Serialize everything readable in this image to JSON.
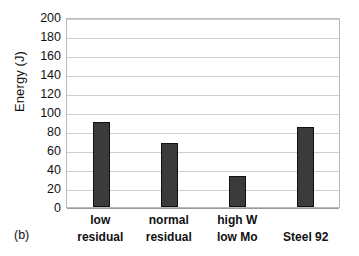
{
  "figure": {
    "panel_label": "(b)"
  },
  "chart_data": {
    "type": "bar",
    "title": "",
    "xlabel": "",
    "ylabel": "Energy (J)",
    "categories": [
      "low residual",
      "normal residual",
      "high W low Mo",
      "Steel 92"
    ],
    "category_lines": [
      [
        "low",
        "residual"
      ],
      [
        "normal",
        "residual"
      ],
      [
        "high W",
        "low Mo"
      ],
      [
        "Steel 92"
      ]
    ],
    "values": [
      90,
      67,
      33,
      84
    ],
    "ylim": [
      0,
      200
    ],
    "ytick_step": 20,
    "yticks": [
      200,
      180,
      160,
      140,
      120,
      100,
      80,
      60,
      40,
      20,
      0
    ],
    "ytick_labels": [
      "200",
      "180",
      "160",
      "140",
      "120",
      "100",
      "80",
      "60",
      "40",
      "20",
      "0"
    ],
    "grid": "horizontal",
    "legend": "none",
    "bar_color": "#3b3b3b",
    "bar_edge_color": "#111111",
    "gridline_color": "#cfcfcf",
    "frame_color": "#b9b9b9"
  }
}
